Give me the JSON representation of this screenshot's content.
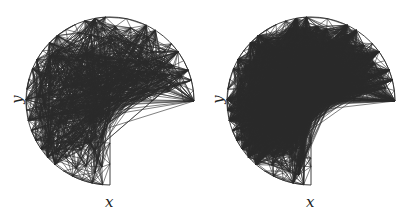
{
  "figures": [
    {
      "id": "uniform-mesh",
      "offset_x": 0,
      "center": [
        110,
        101
      ],
      "radius": 84,
      "spacing": 10.5,
      "refine": null,
      "seed": 7,
      "xlabel": "x",
      "ylabel": "y",
      "xlabel_pos": [
        105,
        195
      ],
      "ylabel_pos": [
        13,
        92
      ]
    },
    {
      "id": "adaptive-mesh",
      "offset_x": 201,
      "center": [
        110,
        101
      ],
      "radius": 84,
      "spacing": 10.5,
      "refine": {
        "min_spacing": 2.6,
        "radius": 32
      },
      "seed": 13,
      "xlabel": "x",
      "ylabel": "y",
      "xlabel_pos": [
        105,
        195
      ],
      "ylabel_pos": [
        13,
        92
      ]
    }
  ],
  "style": {
    "stroke": "#2a2a2a",
    "stroke_width": 0.6,
    "boundary_width": 0.9
  }
}
